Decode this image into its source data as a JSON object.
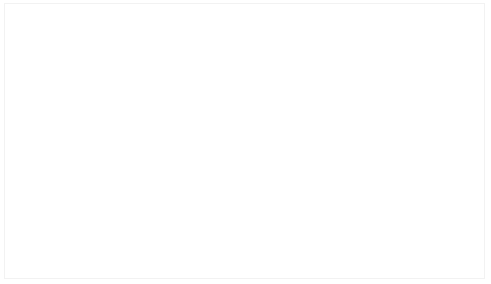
{
  "chart_data": {
    "type": "bar",
    "subtype": "stacked-percent",
    "title": "",
    "xlabel": "",
    "ylabel": "",
    "ylim": [
      0,
      100
    ],
    "ytick_labels": [
      "100%",
      "90%",
      "80%",
      "70%",
      "60%",
      "50%",
      "40%",
      "30%",
      "20%",
      "10%",
      "0%"
    ],
    "ytick_values": [
      100,
      90,
      80,
      70,
      60,
      50,
      40,
      30,
      20,
      10,
      0
    ],
    "grid": true,
    "legend_position": "table-left",
    "categories": [
      "2004",
      "2005",
      "2006",
      "2007",
      "2008",
      "2009",
      "2010",
      "2012"
    ],
    "series": [
      {
        "name": "未出租",
        "color": "#DFDFDF",
        "values": [
          670,
          665,
          641,
          551,
          441,
          341,
          301,
          171
        ],
        "percent": [
          99.9,
          99.1,
          95.5,
          82.1,
          65.7,
          50.8,
          44.9,
          25.5
        ]
      },
      {
        "name": "已出租",
        "color": "#595959",
        "values": [
          1,
          6,
          30,
          120,
          230,
          330,
          370,
          500
        ],
        "percent": [
          0.1,
          0.9,
          4.5,
          17.9,
          34.3,
          49.2,
          55.1,
          74.5
        ]
      }
    ]
  },
  "table": {
    "header_row_label": "",
    "years": [
      "2004",
      "2005",
      "2006",
      "2007",
      "2008",
      "2009",
      "2010",
      "2012"
    ],
    "rows": [
      {
        "label": "未出租",
        "swatch_color": "#DFDFDF",
        "values": [
          "670",
          "665",
          "641",
          "551",
          "441",
          "341",
          "301",
          "171"
        ]
      },
      {
        "label": "已出租",
        "swatch_color": "#404040",
        "values": [
          "1",
          "6",
          "30",
          "120",
          "230",
          "330",
          "370",
          "500"
        ]
      }
    ]
  },
  "colors": {
    "unrented": "#DFDFDF",
    "rented": "#595959",
    "gridline": "#F4F4F4",
    "text": "#595959",
    "border": "#F2F2F2"
  }
}
